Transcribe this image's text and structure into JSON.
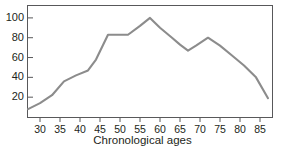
{
  "chart_data": {
    "type": "line",
    "title": "",
    "subtitle": "",
    "xlabel": "Chronological ages",
    "ylabel": "",
    "xlim": [
      27,
      88
    ],
    "ylim": [
      0,
      112
    ],
    "xticks": [
      30,
      35,
      40,
      45,
      50,
      55,
      60,
      65,
      70,
      75,
      80,
      85
    ],
    "yticks": [
      20,
      40,
      60,
      80,
      100
    ],
    "grid": false,
    "legend": null,
    "legend_position": "none",
    "line_color": "#8c8c8c",
    "frame_color": "#58585a",
    "text_color": "#231f20",
    "background": "#ffffff",
    "series": [
      {
        "name": "score",
        "x": [
          27,
          30,
          33,
          36,
          39,
          42,
          44,
          47,
          50,
          52,
          55,
          57.5,
          60,
          63,
          65,
          67,
          69,
          72,
          75,
          78,
          81,
          84,
          87
        ],
        "values": [
          8,
          14,
          22,
          36,
          42,
          47,
          58,
          83,
          83,
          83,
          92,
          100,
          90,
          80,
          73,
          67,
          72,
          80,
          72,
          62,
          52,
          40,
          19
        ]
      }
    ],
    "annotations": []
  },
  "axes": {
    "x_tick_labels": [
      "30",
      "35",
      "40",
      "45",
      "50",
      "55",
      "60",
      "65",
      "70",
      "75",
      "80",
      "85"
    ],
    "y_tick_labels": [
      "20",
      "40",
      "60",
      "80",
      "100"
    ],
    "x_axis_title": "Chronological ages"
  }
}
